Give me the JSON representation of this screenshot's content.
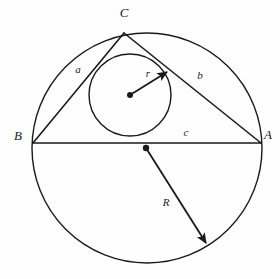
{
  "figure": {
    "background_color": "#fefefe",
    "ink_color": "#1a1a1a"
  },
  "vertices": [
    {
      "id": "C",
      "label": "C",
      "x": 124,
      "y": 33,
      "label_x": 124,
      "label_y": 14
    },
    {
      "id": "B",
      "label": "B",
      "x": 33,
      "y": 143,
      "label_x": 18,
      "label_y": 137
    },
    {
      "id": "A",
      "label": "A",
      "x": 261,
      "y": 143,
      "label_x": 268,
      "label_y": 136
    }
  ],
  "sides": [
    {
      "id": "a",
      "label": "a",
      "from": "B",
      "to": "C",
      "label_x": 78,
      "label_y": 70
    },
    {
      "id": "b",
      "label": "b",
      "from": "C",
      "to": "A",
      "label_x": 200,
      "label_y": 76
    },
    {
      "id": "c",
      "label": "c",
      "from": "B",
      "to": "A",
      "label_x": 186,
      "label_y": 133
    }
  ],
  "circumcircle": {
    "name": "circumcircle",
    "center_x": 147,
    "center_y": 148,
    "radius": 115,
    "center_dot_radius": 3.2,
    "stroke_width": 1.4
  },
  "incircle": {
    "name": "incircle",
    "center_x": 130,
    "center_y": 95,
    "radius": 41,
    "center_dot_radius": 3.0,
    "stroke_width": 1.4
  },
  "radius_arrows": [
    {
      "id": "r",
      "label": "r",
      "belongs_to": "incircle",
      "from_x": 130,
      "from_y": 95,
      "to_x": 167,
      "to_y": 72,
      "label_x": 148,
      "label_y": 74
    },
    {
      "id": "R",
      "label": "R",
      "belongs_to": "circumcircle",
      "from_x": 146,
      "from_y": 148,
      "to_x": 206,
      "to_y": 243,
      "label_x": 166,
      "label_y": 203
    }
  ],
  "triangle": {
    "name": "triangle-abc",
    "stroke_width": 1.6
  }
}
